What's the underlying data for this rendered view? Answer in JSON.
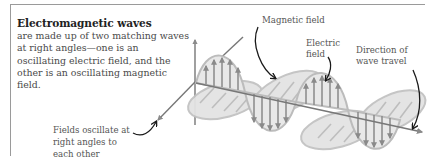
{
  "intro": {
    "heading": "Electromagnetic waves",
    "body": "are made up of two matching waves at right angles—one is an oscillating electric field, and the other is an oscillating magnetic field."
  },
  "labels": {
    "magnetic": "Magnetic field",
    "electric_1": "Electric",
    "electric_2": "field",
    "direction_1": "Direction of",
    "direction_2": "wave travel",
    "fields_1": "Fields oscillate at",
    "fields_2": "right angles to",
    "fields_3": "each other"
  },
  "colors": {
    "wave_fill": "#e3e3e3",
    "wave_stroke": "#b8b8b8",
    "arrow_gray": "#8a8a8a",
    "axis": "#777777",
    "annotation_arrow": "#1a1a1a"
  }
}
